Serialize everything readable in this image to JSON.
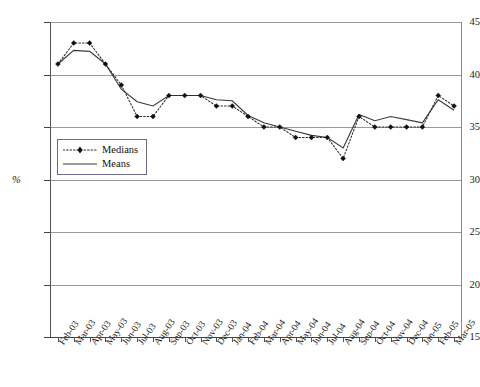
{
  "chart_data": {
    "type": "line",
    "title": "",
    "subtitle": "",
    "xlabel": "",
    "ylabel": "%",
    "ylim": [
      15,
      45
    ],
    "ytick_values": [
      15,
      20,
      25,
      30,
      35,
      40,
      45
    ],
    "ytick_labels": [
      "15",
      "20",
      "25",
      "30",
      "35",
      "40",
      "45"
    ],
    "grid": "horizontal",
    "legend_position": "inside-left",
    "categories": [
      "Feb-03",
      "Mar-03",
      "Apr-03",
      "May-03",
      "Jun-03",
      "Jul-03",
      "Aug-03",
      "Sep-03",
      "Oct-03",
      "Nov-03",
      "Dec-03",
      "Jan-04",
      "Feb-04",
      "Mar-04",
      "Apr-04",
      "May-04",
      "Jun-04",
      "Jul-04",
      "Aug-04",
      "Sep-04",
      "Oct-04",
      "Nov-04",
      "Dec-04",
      "Jan-05",
      "Feb-05",
      "Mar-05"
    ],
    "series": [
      {
        "name": "Medians",
        "style": "dotted-with-markers",
        "color": "#111111",
        "values": [
          41,
          43,
          43,
          41,
          39,
          36,
          36,
          38,
          38,
          38,
          37,
          37,
          36,
          35,
          35,
          34,
          34,
          34,
          32,
          36,
          35,
          35,
          35,
          35,
          38,
          37
        ]
      },
      {
        "name": "Means",
        "style": "solid",
        "color": "#3a3a3a",
        "values": [
          41,
          42.3,
          42.2,
          41,
          38.6,
          37.4,
          37,
          38,
          38,
          38,
          37.6,
          37.5,
          36.1,
          35.4,
          35,
          34.6,
          34.2,
          34,
          33,
          36.2,
          35.6,
          36,
          35.7,
          35.4,
          37.6,
          36.6
        ]
      }
    ]
  },
  "legend": {
    "items": [
      {
        "label": "Medians"
      },
      {
        "label": "Means"
      }
    ]
  },
  "axes": {
    "y_axis_title": "%"
  }
}
